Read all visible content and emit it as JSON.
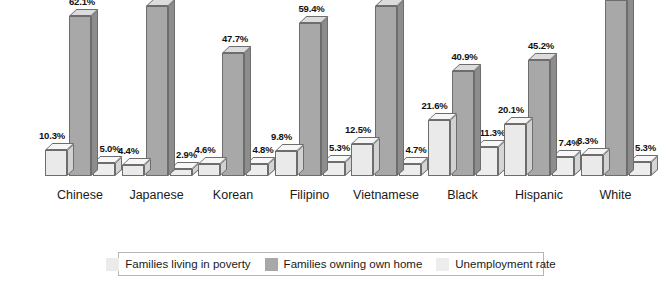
{
  "chart_data": {
    "type": "bar",
    "title": "",
    "subtitle": "",
    "xlabel": "",
    "ylabel": "",
    "ylim": [
      0,
      70
    ],
    "grid": false,
    "legend_position": "bottom",
    "value_suffix": "%",
    "categories": [
      "Chinese",
      "Japanese",
      "Korean",
      "Filipino",
      "Vietnamese",
      "Black",
      "Hispanic",
      "White"
    ],
    "series": [
      {
        "name": "Families living in poverty",
        "color": "#eaeaea",
        "values": [
          10.3,
          4.4,
          4.6,
          9.8,
          12.5,
          21.6,
          20.1,
          8.3
        ],
        "labels": [
          "10.3%",
          "4.4%",
          "4.6%",
          "9.8%",
          "12.5%",
          "21.6%",
          "20.1%",
          "8.3%"
        ]
      },
      {
        "name": "Families owning own home",
        "color": "#a8a8a8",
        "values": [
          62.1,
          66.2,
          47.7,
          59.4,
          66.1,
          40.9,
          45.2,
          68.5
        ],
        "labels": [
          "62.1%",
          "66.2%",
          "47.7%",
          "59.4%",
          "66.1%",
          "40.9%",
          "45.2%",
          "68.5%"
        ]
      },
      {
        "name": "Unemployment rate",
        "color": "#ededed",
        "values": [
          5.0,
          2.9,
          4.8,
          5.3,
          4.7,
          11.3,
          7.4,
          5.3
        ],
        "labels": [
          "5.0%",
          "2.9%",
          "4.8%",
          "5.3%",
          "4.7%",
          "11.3%",
          "7.4%",
          "5.3%"
        ]
      }
    ]
  },
  "legend": {
    "items": [
      {
        "label": "Families living in poverty",
        "swatch": "#ebebeb"
      },
      {
        "label": "Families owning own home",
        "swatch": "#a8a8a8"
      },
      {
        "label": "Unemployment rate",
        "swatch": "#ededed"
      }
    ]
  }
}
